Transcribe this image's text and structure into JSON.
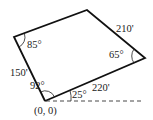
{
  "diagram": {
    "type": "quadrilateral-survey",
    "vertices": {
      "origin": {
        "label": "(0, 0)",
        "px": [
          45,
          101
        ]
      },
      "top_left": {
        "px": [
          14,
          37
        ]
      },
      "top": {
        "px": [
          87,
          10
        ]
      },
      "right": {
        "px": [
          145,
          58
        ]
      }
    },
    "sides": [
      {
        "from": "origin",
        "to": "top_left",
        "length_label": "150'"
      },
      {
        "from": "origin",
        "to": "right",
        "length_label": "220'"
      },
      {
        "from": "right",
        "to": "top",
        "length_label": "210'"
      }
    ],
    "angles": [
      {
        "at": "origin",
        "label": "92°"
      },
      {
        "at": "origin_baseline",
        "label": "25°"
      },
      {
        "at": "top_left",
        "label": "85°"
      },
      {
        "at": "right",
        "label": "65°"
      }
    ],
    "origin_label": "(0, 0)"
  },
  "colors": {
    "stroke": "#111111",
    "text": "#222222",
    "background": "#ffffff"
  }
}
